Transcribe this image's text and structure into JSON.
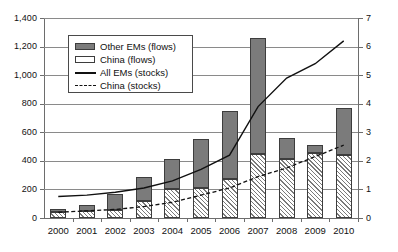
{
  "chart_data": {
    "type": "bar",
    "title": "",
    "subtitle": "",
    "xlabel": "",
    "ylabel": "",
    "y2label": "",
    "grid": true,
    "legend_position": "top-left-inside",
    "categories": [
      "2000",
      "2001",
      "2002",
      "2003",
      "2004",
      "2005",
      "2006",
      "2007",
      "2008",
      "2009",
      "2010"
    ],
    "ylim": [
      0,
      1400
    ],
    "ytick_labels": [
      "0",
      "200",
      "400",
      "600",
      "800",
      "1,000",
      "1,200",
      "1,400"
    ],
    "ytick_values": [
      0,
      200,
      400,
      600,
      800,
      1000,
      1200,
      1400
    ],
    "y2lim": [
      0,
      7
    ],
    "y2tick_labels": [
      "0",
      "1",
      "2",
      "3",
      "4",
      "5",
      "6",
      "7"
    ],
    "y2tick_values": [
      0,
      1,
      2,
      3,
      4,
      5,
      6,
      7
    ],
    "stacked": true,
    "series": [
      {
        "name": "China (flows)",
        "kind": "bar-segment",
        "axis": "left",
        "style": "hatched",
        "values": [
          40,
          47,
          53,
          120,
          200,
          210,
          270,
          450,
          410,
          455,
          440
        ]
      },
      {
        "name": "Other EMs (flows)",
        "kind": "bar-segment",
        "axis": "left",
        "style": "solid-gray",
        "values": [
          25,
          45,
          115,
          170,
          215,
          340,
          480,
          810,
          150,
          55,
          330
        ]
      },
      {
        "name": "All EMs (stocks)",
        "kind": "line",
        "axis": "right",
        "style": "solid",
        "values": [
          0.75,
          0.8,
          0.9,
          1.05,
          1.3,
          1.7,
          2.2,
          3.9,
          4.9,
          5.4,
          6.2
        ]
      },
      {
        "name": "China (stocks)",
        "kind": "line",
        "axis": "right",
        "style": "dashed",
        "values": [
          0.2,
          0.25,
          0.3,
          0.4,
          0.55,
          0.8,
          1.05,
          1.45,
          1.75,
          2.15,
          2.55
        ]
      }
    ],
    "totals": [
      65,
      92,
      168,
      290,
      415,
      550,
      750,
      1260,
      560,
      510,
      770
    ]
  },
  "legend": {
    "items": [
      {
        "label": "Other EMs (flows)",
        "key": "swatch-solid-gray"
      },
      {
        "label": "China (flows)",
        "key": "swatch-white"
      },
      {
        "label": "All EMs (stocks)",
        "key": "line-solid"
      },
      {
        "label": "China (stocks)",
        "key": "line-dashed"
      }
    ]
  },
  "colors": {
    "other_ems_fill": "#7b7b7b",
    "china_fill": "#ffffff",
    "bar_outline": "#3d3d3d",
    "gridline": "#8a8a8a",
    "axis": "#6d6d6d",
    "line": "#111111",
    "background": "#ffffff"
  },
  "caption": ""
}
